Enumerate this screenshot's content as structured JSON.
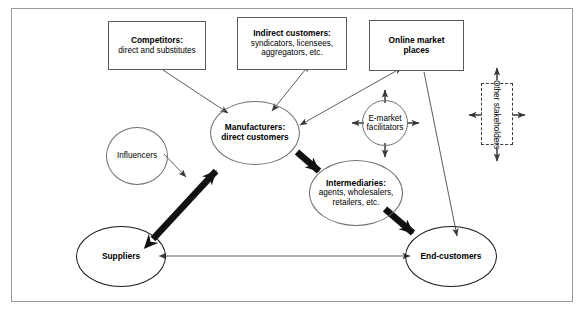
{
  "diagram": {
    "frame": {
      "border_color": "#9a9a9a"
    },
    "nodes": {
      "competitors": {
        "title": "Competitors:",
        "subtitle": "direct and substitutes",
        "shape": "rectangle"
      },
      "indirect_customers": {
        "title": "Indirect customers:",
        "line1": "syndicators, licensees,",
        "line2": "aggregators, etc.",
        "shape": "rectangle"
      },
      "online_market_places": {
        "line1": "Online market",
        "line2": "places",
        "shape": "rectangle"
      },
      "other_stakeholders": {
        "label": "Other stakeholders",
        "shape": "dashed-rectangle",
        "orientation": "vertical"
      },
      "manufacturers": {
        "line1": "Manufacturers:",
        "line2": "direct customers",
        "shape": "ellipse"
      },
      "e_market_facilitators": {
        "line1": "E-market",
        "line2": "facilitators",
        "shape": "circle"
      },
      "intermediaries": {
        "title": "Intermediaries:",
        "line1": "agents, wholesalers,",
        "line2": "retailers, etc.",
        "shape": "ellipse"
      },
      "influencers": {
        "label": "Influencers",
        "shape": "circle"
      },
      "suppliers": {
        "label": "Suppliers",
        "shape": "ellipse-thick"
      },
      "end_customers": {
        "label": "End-customers",
        "shape": "ellipse-thick"
      }
    },
    "connections": [
      {
        "from": "competitors",
        "to": "manufacturers",
        "style": "thin",
        "direction": "one-way"
      },
      {
        "from": "indirect_customers",
        "to": "manufacturers",
        "style": "thin",
        "direction": "two-way"
      },
      {
        "from": "online_market_places",
        "to": "manufacturers",
        "style": "thin",
        "direction": "two-way"
      },
      {
        "from": "online_market_places",
        "to": "end_customers",
        "style": "thin",
        "direction": "one-way"
      },
      {
        "from": "e_market_facilitators",
        "to": "online_market_places",
        "style": "thin",
        "direction": "one-way"
      },
      {
        "from": "e_market_facilitators",
        "to": "intermediaries",
        "style": "thin",
        "direction": "one-way"
      },
      {
        "from": "e_market_facilitators",
        "to": "left",
        "style": "thin",
        "direction": "one-way"
      },
      {
        "from": "e_market_facilitators",
        "to": "right",
        "style": "thin",
        "direction": "one-way"
      },
      {
        "from": "influencers",
        "to": "manufacturers",
        "style": "thin",
        "direction": "one-way"
      },
      {
        "from": "suppliers",
        "to": "manufacturers",
        "style": "thick",
        "direction": "two-way"
      },
      {
        "from": "manufacturers",
        "to": "intermediaries",
        "style": "thick",
        "direction": "one-way"
      },
      {
        "from": "intermediaries",
        "to": "end_customers",
        "style": "thick",
        "direction": "one-way"
      },
      {
        "from": "suppliers",
        "to": "end_customers",
        "style": "thin",
        "direction": "two-way"
      },
      {
        "from": "other_stakeholders",
        "to": "up",
        "style": "thin",
        "direction": "one-way"
      },
      {
        "from": "other_stakeholders",
        "to": "down",
        "style": "thin",
        "direction": "one-way"
      },
      {
        "from": "other_stakeholders",
        "to": "left",
        "style": "thin",
        "direction": "one-way"
      },
      {
        "from": "other_stakeholders",
        "to": "right",
        "style": "thin",
        "direction": "one-way"
      }
    ],
    "colors": {
      "line_thin": "#4a4a4a",
      "line_thick": "#111111",
      "node_border": "#6e6e6e",
      "box_border": "#5a5a5a",
      "text": "#000000"
    }
  }
}
